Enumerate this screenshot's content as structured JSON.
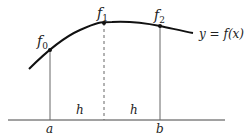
{
  "diagram": {
    "curve_label": "y = f(x)",
    "points": [
      {
        "label": "f",
        "sub": "0"
      },
      {
        "label": "f",
        "sub": "1"
      },
      {
        "label": "f",
        "sub": "2"
      }
    ],
    "axis_labels": {
      "a": "a",
      "b": "b"
    },
    "interval_labels": [
      "h",
      "h"
    ],
    "colors": {
      "curve": "#111111",
      "lines": "#555555",
      "text": "#222222"
    }
  }
}
